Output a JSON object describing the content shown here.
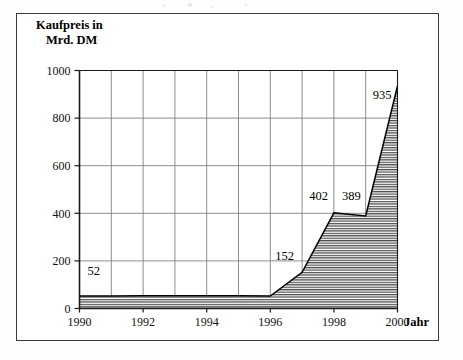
{
  "chart_data": {
    "type": "area",
    "title": "Kaufpreis in Mrd. DM",
    "title_line1": "Kaufpreis in",
    "title_line2": "Mrd. DM",
    "xlabel": "Jahr",
    "ylabel": "Kaufpreis in Mrd. DM",
    "x": [
      1990,
      1991,
      1992,
      1993,
      1994,
      1995,
      1996,
      1997,
      1998,
      1999,
      2000
    ],
    "values": [
      52,
      53,
      54,
      54,
      54,
      54,
      52,
      152,
      402,
      389,
      935
    ],
    "xlim": [
      1990,
      2000
    ],
    "ylim": [
      0,
      1000
    ],
    "y_ticks": [
      "0",
      "200",
      "400",
      "600",
      "800",
      "1000"
    ],
    "y_tick_values": [
      0,
      200,
      400,
      600,
      800,
      1000
    ],
    "x_ticks": [
      "1990",
      "1992",
      "1994",
      "1996",
      "1998",
      "2000"
    ],
    "x_tick_values": [
      1990,
      1992,
      1994,
      1996,
      1998,
      2000
    ],
    "x_gridline_values": [
      1990,
      1991,
      1992,
      1993,
      1994,
      1995,
      1996,
      1997,
      1998,
      1999,
      2000
    ],
    "grid": true,
    "legend": "none",
    "fill_pattern": "horizontal-hatch",
    "data_labels": [
      {
        "label": "52",
        "x": 1990.45,
        "y": 140
      },
      {
        "label": "152",
        "x": 1996.45,
        "y": 205
      },
      {
        "label": "402",
        "x": 1997.52,
        "y": 455
      },
      {
        "label": "389",
        "x": 1998.55,
        "y": 455
      },
      {
        "label": "935",
        "x": 1999.52,
        "y": 880
      }
    ]
  },
  "colors": {
    "frame": "#3a3a3a",
    "axis": "#1a1a1a",
    "grid": "#808080",
    "series_line": "#000000",
    "fill_hatch": "#555555",
    "background": "#ffffff",
    "text": "#111111"
  }
}
